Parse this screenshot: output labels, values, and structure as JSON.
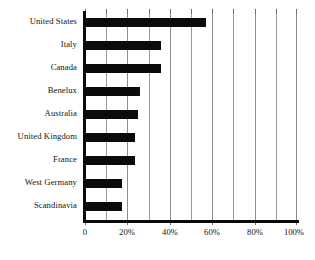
{
  "chart_data": {
    "type": "bar",
    "orientation": "horizontal",
    "title": "",
    "subtitle": "",
    "xlabel": "",
    "ylabel": "",
    "categories": [
      "United States",
      "Italy",
      "Canada",
      "Benelux",
      "Australia",
      "United Kingdom",
      "France",
      "West Germany",
      "Scandinavia"
    ],
    "values": [
      57,
      36,
      36,
      26,
      25,
      23.5,
      23.5,
      17.5,
      17.5
    ],
    "value_unit": "%",
    "xlim": [
      0,
      100
    ],
    "xticks": [
      0,
      20,
      40,
      60,
      80,
      100
    ],
    "xtick_labels": [
      "0",
      "20%",
      "40%",
      "60%",
      "80%",
      "100%"
    ],
    "gridline_values": [
      0,
      10,
      20,
      30,
      40,
      50,
      60,
      70,
      80,
      90,
      100
    ],
    "grid": true,
    "legend": false,
    "legend_position": "none",
    "series": [
      {
        "name": "",
        "values": [
          57,
          36,
          36,
          26,
          25,
          23.5,
          23.5,
          17.5,
          17.5
        ]
      }
    ],
    "colors": {
      "bar": "#0b0b0b",
      "gridline": "#9a9a9a",
      "axis": "#0a0a0a",
      "background": "#ffffff",
      "text": "#131313"
    }
  }
}
